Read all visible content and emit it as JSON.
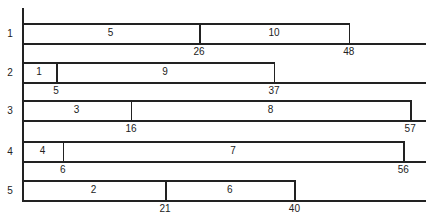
{
  "chart_data": {
    "type": "gantt",
    "title": "",
    "rows": [
      {
        "label": "1",
        "segments": [
          {
            "label": "5",
            "start": 0,
            "end": 26
          },
          {
            "label": "10",
            "start": 26,
            "end": 48
          }
        ],
        "ticks": [
          "26",
          "48"
        ]
      },
      {
        "label": "2",
        "segments": [
          {
            "label": "1",
            "start": 0,
            "end": 5
          },
          {
            "label": "9",
            "start": 5,
            "end": 37
          }
        ],
        "ticks": [
          "5",
          "37"
        ]
      },
      {
        "label": "3",
        "segments": [
          {
            "label": "3",
            "start": 0,
            "end": 16
          },
          {
            "label": "8",
            "start": 16,
            "end": 57
          }
        ],
        "ticks": [
          "16",
          "57"
        ]
      },
      {
        "label": "4",
        "segments": [
          {
            "label": "4",
            "start": 0,
            "end": 6
          },
          {
            "label": "7",
            "start": 6,
            "end": 56
          }
        ],
        "ticks": [
          "6",
          "56"
        ]
      },
      {
        "label": "5",
        "segments": [
          {
            "label": "2",
            "start": 0,
            "end": 21
          },
          {
            "label": "6",
            "start": 21,
            "end": 40
          }
        ],
        "ticks": [
          "21",
          "40"
        ]
      }
    ],
    "xrange": [
      0,
      60
    ],
    "grid": false
  }
}
